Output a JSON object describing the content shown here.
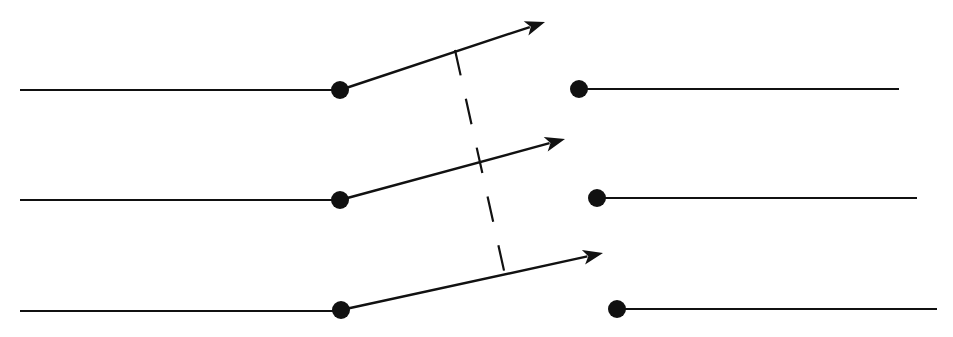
{
  "diagram": {
    "type": "three-pole switch (open)",
    "colors": {
      "stroke": "#111111",
      "background": "#ffffff"
    },
    "poles": [
      {
        "label": "",
        "left_wire": {
          "x1": 20,
          "y1": 90,
          "x2": 340,
          "y2": 90
        },
        "pivot": {
          "cx": 340,
          "cy": 90,
          "r": 9
        },
        "blade": {
          "x1": 340,
          "y1": 90,
          "x2": 545,
          "y2": 22
        },
        "right_terminal": {
          "cx": 579,
          "cy": 89,
          "r": 9
        },
        "right_wire": {
          "x1": 579,
          "y1": 89,
          "x2": 899,
          "y2": 89
        }
      },
      {
        "label": "",
        "left_wire": {
          "x1": 20,
          "y1": 200,
          "x2": 340,
          "y2": 200
        },
        "pivot": {
          "cx": 340,
          "cy": 200,
          "r": 9
        },
        "blade": {
          "x1": 340,
          "y1": 200,
          "x2": 565,
          "y2": 139
        },
        "right_terminal": {
          "cx": 597,
          "cy": 198,
          "r": 9
        },
        "right_wire": {
          "x1": 597,
          "y1": 198,
          "x2": 917,
          "y2": 198
        }
      },
      {
        "label": "",
        "left_wire": {
          "x1": 20,
          "y1": 311,
          "x2": 341,
          "y2": 311
        },
        "pivot": {
          "cx": 341,
          "cy": 310,
          "r": 9
        },
        "blade": {
          "x1": 341,
          "y1": 310,
          "x2": 603,
          "y2": 253
        },
        "right_terminal": {
          "cx": 617,
          "cy": 309,
          "r": 9
        },
        "right_wire": {
          "x1": 617,
          "y1": 309,
          "x2": 937,
          "y2": 309
        }
      }
    ],
    "linkage": {
      "x1": 455,
      "y1": 50,
      "x2": 505,
      "y2": 275,
      "dasharray": "26 24"
    }
  }
}
